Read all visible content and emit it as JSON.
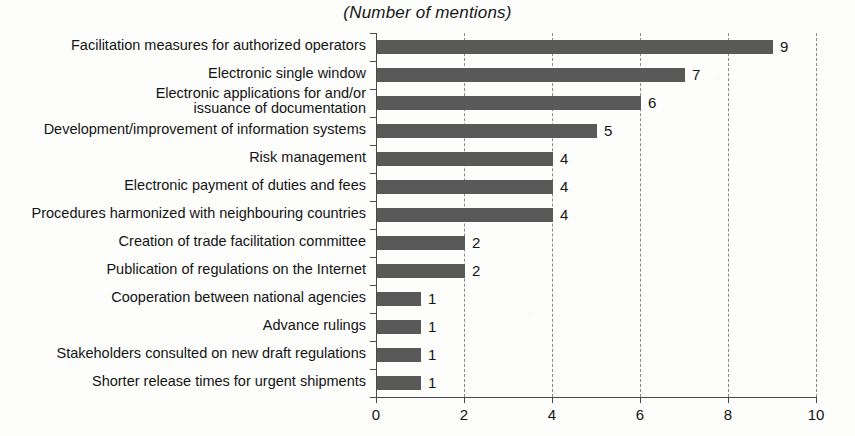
{
  "chart_data": {
    "type": "bar",
    "orientation": "horizontal",
    "title": "(Number of mentions)",
    "xlabel": "",
    "ylabel": "",
    "xlim": [
      0,
      10
    ],
    "xticks": [
      "0",
      "2",
      "4",
      "6",
      "8",
      "10"
    ],
    "gridlines": [
      "2",
      "4",
      "6",
      "8",
      "10"
    ],
    "grid": true,
    "legend": "none",
    "bar_color": "#595959",
    "axis_color": "#4a4a4a",
    "categories": [
      "Facilitation measures for authorized operators",
      "Electronic single window",
      "Electronic applications for and/or\nissuance of documentation",
      "Development/improvement of information systems",
      "Risk management",
      "Electronic payment of duties and fees",
      "Procedures harmonized with neighbouring countries",
      "Creation of trade facilitation committee",
      "Publication of regulations on the Internet",
      "Cooperation between national agencies",
      "Advance rulings",
      "Stakeholders consulted on new draft regulations",
      "Shorter release times for urgent shipments"
    ],
    "values": [
      9,
      7,
      6,
      5,
      4,
      4,
      4,
      2,
      2,
      1,
      1,
      1,
      1
    ],
    "value_labels": [
      "9",
      "7",
      "6",
      "5",
      "4",
      "4",
      "4",
      "2",
      "2",
      "1",
      "1",
      "1",
      "1"
    ]
  }
}
